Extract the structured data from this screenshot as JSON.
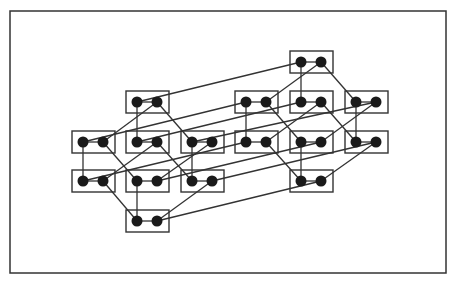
{
  "diagram": {
    "type": "hypercube-graph",
    "frame": {
      "x": 10,
      "y": 11,
      "w": 436,
      "h": 262
    },
    "colors": {
      "stroke": "#333333",
      "node": "#1a1a1a",
      "background": "#ffffff"
    },
    "box": {
      "w": 43,
      "h": 22
    },
    "node_radius": 5.5,
    "boxes": [
      {
        "id": "L-top",
        "x": 126,
        "y": 91
      },
      {
        "id": "L-m1",
        "x": 72,
        "y": 131
      },
      {
        "id": "L-m2",
        "x": 126,
        "y": 131
      },
      {
        "id": "L-m3",
        "x": 181,
        "y": 131
      },
      {
        "id": "L-l1",
        "x": 72,
        "y": 170
      },
      {
        "id": "L-l2",
        "x": 126,
        "y": 170
      },
      {
        "id": "L-l3",
        "x": 181,
        "y": 170
      },
      {
        "id": "L-bot",
        "x": 126,
        "y": 210
      },
      {
        "id": "R-top",
        "x": 290,
        "y": 51
      },
      {
        "id": "R-m1",
        "x": 235,
        "y": 91
      },
      {
        "id": "R-m2",
        "x": 290,
        "y": 91
      },
      {
        "id": "R-m3",
        "x": 345,
        "y": 91
      },
      {
        "id": "R-l1",
        "x": 235,
        "y": 131
      },
      {
        "id": "R-l2",
        "x": 290,
        "y": 131
      },
      {
        "id": "R-l3",
        "x": 345,
        "y": 131
      },
      {
        "id": "R-bot",
        "x": 290,
        "y": 170
      }
    ],
    "edges": [
      [
        "L-top.A",
        "L-m2.A"
      ],
      [
        "L-top.B",
        "L-m1.B"
      ],
      [
        "L-top.B",
        "L-m3.A"
      ],
      [
        "L-m1.A",
        "L-l1.A"
      ],
      [
        "L-m1.B",
        "L-l2.A"
      ],
      [
        "L-m2.B",
        "L-l1.B"
      ],
      [
        "L-m2.B",
        "L-l3.A"
      ],
      [
        "L-m3.A",
        "L-l3.A"
      ],
      [
        "L-m3.B",
        "L-l2.B"
      ],
      [
        "L-l1.B",
        "L-bot.A"
      ],
      [
        "L-l2.A",
        "L-bot.A"
      ],
      [
        "L-l3.B",
        "L-bot.B"
      ],
      [
        "R-top.A",
        "R-m2.A"
      ],
      [
        "R-top.B",
        "R-m1.B"
      ],
      [
        "R-top.B",
        "R-m3.A"
      ],
      [
        "R-m1.A",
        "R-l1.A"
      ],
      [
        "R-m1.B",
        "R-l2.A"
      ],
      [
        "R-m2.B",
        "R-l1.B"
      ],
      [
        "R-m2.B",
        "R-l3.A"
      ],
      [
        "R-m3.A",
        "R-l3.A"
      ],
      [
        "R-m3.B",
        "R-l2.B"
      ],
      [
        "R-l1.B",
        "R-bot.A"
      ],
      [
        "R-l2.A",
        "R-bot.A"
      ],
      [
        "R-l3.B",
        "R-bot.B"
      ],
      [
        "L-top.A",
        "R-top.A"
      ],
      [
        "L-m1.A",
        "R-m1.A"
      ],
      [
        "L-m2.A",
        "R-m2.A"
      ],
      [
        "L-m3.A",
        "R-m3.B"
      ],
      [
        "L-l1.A",
        "R-l1.A"
      ],
      [
        "L-l2.B",
        "R-l2.B"
      ],
      [
        "L-l3.B",
        "R-l3.B"
      ],
      [
        "L-bot.B",
        "R-bot.B"
      ]
    ]
  }
}
